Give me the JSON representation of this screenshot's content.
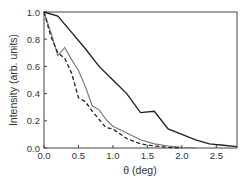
{
  "chart_data": {
    "type": "line",
    "title": "",
    "xlabel": "θ (deg)",
    "ylabel": "Intensity (arb. units)",
    "xlim": [
      0,
      2.8
    ],
    "ylim": [
      0,
      1.0
    ],
    "xticks": [
      "0.0",
      "0.5",
      "1.0",
      "1.5",
      "2.0",
      "2.5"
    ],
    "yticks": [
      "0.0",
      "0.2",
      "0.4",
      "0.6",
      "0.8",
      "1.0"
    ],
    "grid": false,
    "legend": null,
    "series": [
      {
        "name": "solid-dark",
        "style": "solid",
        "color": "#222222",
        "x": [
          0,
          0.2,
          0.4,
          0.6,
          0.8,
          1.0,
          1.2,
          1.4,
          1.6,
          1.8,
          2.0,
          2.2,
          2.4,
          2.6,
          2.8
        ],
        "y": [
          1.0,
          0.97,
          0.85,
          0.73,
          0.6,
          0.5,
          0.4,
          0.26,
          0.27,
          0.14,
          0.1,
          0.06,
          0.03,
          0.02,
          0.01
        ]
      },
      {
        "name": "solid-gray",
        "style": "solid",
        "color": "#777777",
        "x": [
          0,
          0.1,
          0.2,
          0.3,
          0.4,
          0.5,
          0.6,
          0.7,
          0.8,
          0.9,
          1.0,
          1.2,
          1.4,
          1.6,
          1.8,
          2.0,
          2.2
        ],
        "y": [
          1.0,
          0.85,
          0.68,
          0.74,
          0.65,
          0.57,
          0.45,
          0.31,
          0.28,
          0.21,
          0.16,
          0.11,
          0.06,
          0.03,
          0.015,
          0.005,
          0.0
        ]
      },
      {
        "name": "dashed",
        "style": "dashed",
        "color": "#222222",
        "x": [
          0,
          0.1,
          0.2,
          0.3,
          0.4,
          0.5,
          0.6,
          0.7,
          0.8,
          0.9,
          1.0,
          1.2,
          1.4,
          1.6,
          1.8,
          2.0
        ],
        "y": [
          1.0,
          0.82,
          0.7,
          0.66,
          0.55,
          0.37,
          0.34,
          0.27,
          0.21,
          0.15,
          0.14,
          0.07,
          0.03,
          0.015,
          0.005,
          0.0
        ]
      }
    ]
  }
}
